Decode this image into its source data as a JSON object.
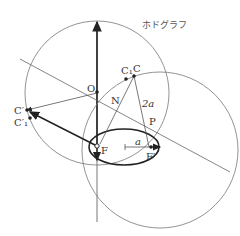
{
  "title": "ホドグラフ",
  "labels": {
    "O": "O",
    "C": "C",
    "C1": "C₁",
    "C_prime": "C′",
    "C1_prime": "C′₁",
    "N": "N",
    "P": "P",
    "F": "F",
    "F_prime": "F′",
    "two_a": "2a",
    "a": "a"
  },
  "colors": {
    "line": "#555555",
    "thick": "#222222",
    "text": "#333333"
  }
}
